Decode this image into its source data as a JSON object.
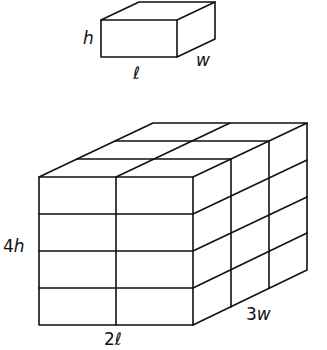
{
  "diagram": {
    "type": "box-stacking",
    "small_box": {
      "labels": {
        "height": "h",
        "length": "ℓ",
        "width": "w"
      }
    },
    "large_box": {
      "grid": {
        "length_units": 2,
        "width_units": 3,
        "height_units": 4
      },
      "labels": {
        "height": "4h",
        "length": "2ℓ",
        "width": "3w"
      }
    }
  }
}
